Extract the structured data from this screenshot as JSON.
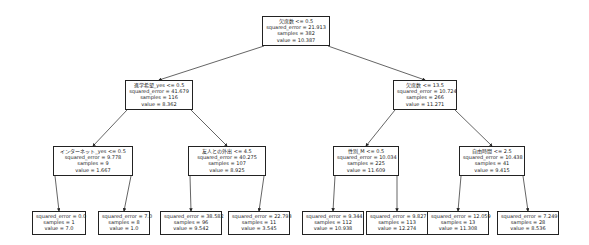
{
  "nodes": [
    {
      "id": "n0",
      "split": "欠席数 <= 0.5",
      "squared_error": "squared_error = 21.913",
      "samples": "samples = 382",
      "value": "value = 10.387"
    },
    {
      "id": "n1",
      "split": "進学希望_yes <= 0.5",
      "squared_error": "squared_error = 41.679",
      "samples": "samples = 116",
      "value": "value = 8.362"
    },
    {
      "id": "n2",
      "split": "インターネット_yes <= 0.5",
      "squared_error": "squared_error = 9.778",
      "samples": "samples = 9",
      "value": "value = 1.667"
    },
    {
      "id": "n3",
      "split": "",
      "squared_error": "squared_error = 0.0",
      "samples": "samples = 1",
      "value": "value = 7.0"
    },
    {
      "id": "n4",
      "split": "",
      "squared_error": "squared_error = 7.0",
      "samples": "samples = 8",
      "value": "value = 1.0"
    },
    {
      "id": "n5",
      "split": "友人との外出 <= 4.5",
      "squared_error": "squared_error = 40.275",
      "samples": "samples = 107",
      "value": "value = 8.925"
    },
    {
      "id": "n6",
      "split": "",
      "squared_error": "squared_error = 38.582",
      "samples": "samples = 96",
      "value": "value = 9.542"
    },
    {
      "id": "n7",
      "split": "",
      "squared_error": "squared_error = 22.793",
      "samples": "samples = 11",
      "value": "value = 3.545"
    },
    {
      "id": "n8",
      "split": "欠席数 <= 13.5",
      "squared_error": "squared_error = 10.724",
      "samples": "samples = 266",
      "value": "value = 11.271"
    },
    {
      "id": "n9",
      "split": "性別_M <= 0.5",
      "squared_error": "squared_error = 10.034",
      "samples": "samples = 225",
      "value": "value = 11.609"
    },
    {
      "id": "n10",
      "split": "",
      "squared_error": "squared_error = 9.344",
      "samples": "samples = 112",
      "value": "value = 10.938"
    },
    {
      "id": "n11",
      "split": "",
      "squared_error": "squared_error = 9.827",
      "samples": "samples = 113",
      "value": "value = 12.274"
    },
    {
      "id": "n12",
      "split": "自由時間 <= 2.5",
      "squared_error": "squared_error = 10.438",
      "samples": "samples = 41",
      "value": "value = 9.415"
    },
    {
      "id": "n13",
      "split": "",
      "squared_error": "squared_error = 12.059",
      "samples": "samples = 13",
      "value": "value = 11.308"
    },
    {
      "id": "n14",
      "split": "",
      "squared_error": "squared_error = 7.249",
      "samples": "samples = 28",
      "value": "value = 8.536"
    }
  ],
  "edges": [
    [
      "n0",
      "n1"
    ],
    [
      "n0",
      "n8"
    ],
    [
      "n1",
      "n2"
    ],
    [
      "n1",
      "n5"
    ],
    [
      "n2",
      "n3"
    ],
    [
      "n2",
      "n4"
    ],
    [
      "n5",
      "n6"
    ],
    [
      "n5",
      "n7"
    ],
    [
      "n8",
      "n9"
    ],
    [
      "n8",
      "n12"
    ],
    [
      "n9",
      "n10"
    ],
    [
      "n9",
      "n11"
    ],
    [
      "n12",
      "n13"
    ],
    [
      "n12",
      "n14"
    ]
  ]
}
